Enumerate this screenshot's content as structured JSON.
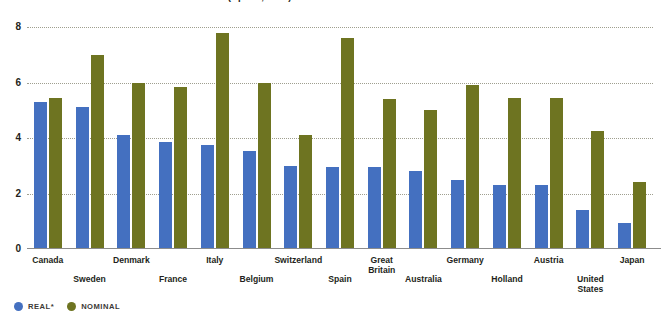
{
  "figure": {
    "title": "FIGURE 3-3 Nominal and real interest rates (April 1, 1997)"
  },
  "legend": {
    "items": [
      {
        "label": "REAL*",
        "color": "#4470c0",
        "key": "real"
      },
      {
        "label": "NOMINAL",
        "color": "#6e7421",
        "key": "nominal"
      }
    ]
  },
  "chart_data": {
    "type": "bar",
    "title": "FIGURE 3-3 Nominal and real interest rates (April 1, 1997)",
    "xlabel": "",
    "ylabel": "",
    "ylim": [
      0,
      8
    ],
    "yticks": [
      0,
      2,
      4,
      6,
      8
    ],
    "ytick_labels": [
      "0",
      "2",
      "4",
      "6",
      "8"
    ],
    "grid": "dotted-horizontal",
    "legend_position": "bottom-left",
    "categories": [
      "Canada",
      "Sweden",
      "Denmark",
      "France",
      "Italy",
      "Belgium",
      "Switzerland",
      "Spain",
      "Great Britain",
      "Australia",
      "Germany",
      "Holland",
      "Austria",
      "United States",
      "Japan"
    ],
    "category_label_rows": [
      "top",
      "bottom",
      "top",
      "bottom",
      "top",
      "bottom",
      "top",
      "bottom",
      "top",
      "bottom",
      "top",
      "bottom",
      "top",
      "bottom",
      "top"
    ],
    "series": [
      {
        "name": "REAL*",
        "color": "#4470c0",
        "values": [
          5.3,
          5.1,
          4.1,
          3.85,
          3.75,
          3.55,
          3.0,
          2.95,
          2.95,
          2.8,
          2.5,
          2.3,
          2.3,
          1.4,
          0.95
        ]
      },
      {
        "name": "NOMINAL",
        "color": "#6e7421",
        "values": [
          5.45,
          7.0,
          6.0,
          5.85,
          7.8,
          6.0,
          4.1,
          7.6,
          5.4,
          5.0,
          5.9,
          5.45,
          5.45,
          4.25,
          2.4
        ]
      }
    ]
  }
}
